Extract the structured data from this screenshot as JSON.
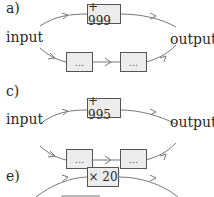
{
  "diagrams": [
    {
      "label": "a)",
      "input_label": "input",
      "output_label": "output",
      "top_operation": "+ 999",
      "bottom_boxes": [
        "...",
        "..."
      ]
    },
    {
      "label": "c)",
      "input_label": "input",
      "output_label": "output",
      "top_operation": "+ 995",
      "bottom_boxes": [
        "...",
        "..."
      ]
    },
    {
      "label": "e)",
      "top_operation": "× 20"
    }
  ],
  "colors": {
    "line": "#777777",
    "box_fill": "#ececec",
    "box_border": "#555555",
    "text": "#2a2a2a"
  }
}
